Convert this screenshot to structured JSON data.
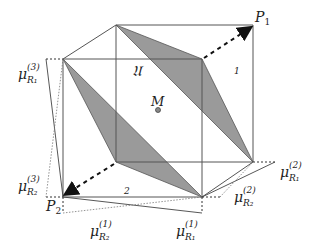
{
  "labels": {
    "P1": "P",
    "P1_sub": "1",
    "P2": "P",
    "P2_sub": "2",
    "U": "𝔘",
    "C1": "𝔆",
    "C1_sub": "1",
    "C2": "𝔆",
    "C2_sub": "2",
    "M": "M",
    "mu": "μ",
    "mu_R1_3_sup": "(3)",
    "mu_R1_3_sub": "R₁",
    "mu_R2_3_sup": "(3)",
    "mu_R2_3_sub": "R₂",
    "mu_R1_2_sup": "(2)",
    "mu_R1_2_sub": "R₁",
    "mu_R2_2_sup": "(2)",
    "mu_R2_2_sub": "R₂",
    "mu_R2_1_sup": "(1)",
    "mu_R2_1_sub": "R₂",
    "mu_R1_1_sup": "(1)",
    "mu_R1_1_sub": "R₁"
  },
  "colors": {
    "shade": "#9a9a9a",
    "edge": "#555555",
    "text": "#222222"
  }
}
